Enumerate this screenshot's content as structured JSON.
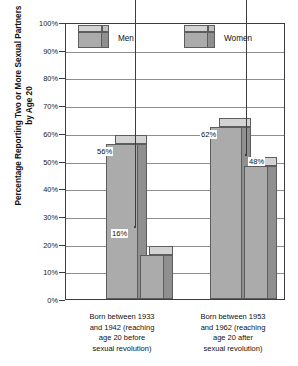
{
  "chart_data": {
    "type": "bar",
    "title": "",
    "xlabel": "",
    "ylabel": "Percentage Reporting Two or More Sexual Partners by Age 20",
    "ylim": [
      0,
      100
    ],
    "ytick_labels": [
      "100%",
      "90%",
      "80%",
      "70%",
      "60%",
      "50%",
      "40%",
      "30%",
      "20%",
      "10%",
      "0%"
    ],
    "ytick_values": [
      100,
      90,
      80,
      70,
      60,
      50,
      40,
      30,
      20,
      10,
      0
    ],
    "grid": true,
    "legend_position": "top-inside",
    "categories": [
      "Born between 1933 and 1942 (reaching age 20 before sexual revolution)",
      "Born between 1953 and 1962 (reaching age 20 after sexual revolution)"
    ],
    "series": [
      {
        "name": "Men",
        "values": [
          56,
          62
        ],
        "value_labels": [
          "56%",
          "62%"
        ]
      },
      {
        "name": "Women",
        "values": [
          16,
          48
        ],
        "value_labels": [
          "16%",
          "48%"
        ]
      }
    ],
    "annotations": [
      {
        "label": "16%",
        "target_series": "Women",
        "target_category_index": 0,
        "leader_line": true
      },
      {
        "label": "48%",
        "target_series": "Women",
        "target_category_index": 1,
        "leader_line": true
      }
    ],
    "style": {
      "bar_face_color": "#ababab",
      "bar_side_color": "#8f8f8f",
      "bar_top_color": "#d3d3d3",
      "outline_color": "#5d5d5d",
      "gridline_color": "#8e8e8e",
      "axis_color": "#3d3d3d",
      "background_color": "#ffffff",
      "text_color": "#111111"
    }
  },
  "legend": {
    "items": [
      {
        "label": "Men"
      },
      {
        "label": "Women"
      }
    ]
  },
  "categories_lines": {
    "left": [
      "Born between 1933",
      "and 1942 (reaching",
      "age 20 before",
      "sexual revolution)"
    ],
    "right": [
      "Born between 1953",
      "and 1962 (reaching",
      "age 20 after",
      "sexual revolution)"
    ]
  },
  "axis": {
    "y_title": "Percentage Reporting Two or More Sexual Partners by Age 20"
  }
}
